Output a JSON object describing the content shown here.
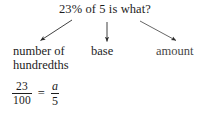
{
  "question": {
    "text": "23% of 5 is what?"
  },
  "labels": {
    "left": {
      "line1": "number of",
      "line2": "hundredths"
    },
    "center": {
      "text": "base"
    },
    "right": {
      "text": "amount"
    }
  },
  "arrows": [
    {
      "name": "arrow-to-number-of-hundredths",
      "direction": "down-left",
      "from": [
        72,
        20
      ],
      "to": [
        38,
        42
      ]
    },
    {
      "name": "arrow-to-base",
      "direction": "down",
      "from": [
        107,
        22
      ],
      "to": [
        107,
        44
      ]
    },
    {
      "name": "arrow-to-amount",
      "direction": "down-right",
      "from": [
        140,
        21
      ],
      "to": [
        178,
        42
      ]
    }
  ],
  "equation": {
    "left_fraction": {
      "numerator": "23",
      "denominator": "100"
    },
    "operator": "=",
    "right_fraction": {
      "numerator": "a",
      "denominator": "5"
    }
  },
  "colors": {
    "background": "#ffffff",
    "text": "#1d1d1d",
    "muted_text": "#474747",
    "rule": "#1d1d1d"
  }
}
